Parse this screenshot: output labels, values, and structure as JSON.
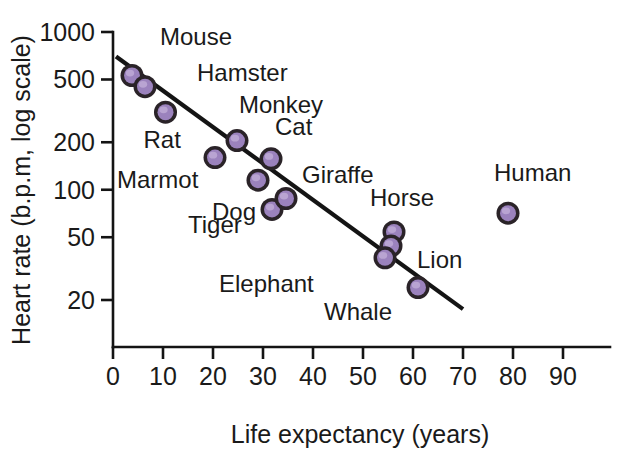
{
  "chart_data": {
    "type": "scatter",
    "title": "",
    "xlabel": "Life expectancy (years)",
    "ylabel": "Heart rate (b.p.m, log scale)",
    "yscale": "log",
    "xlim": [
      0,
      92
    ],
    "ylim": [
      16,
      1100
    ],
    "grid": false,
    "legend": null,
    "xticks": [
      "0",
      "10",
      "20",
      "30",
      "40",
      "50",
      "60",
      "70",
      "80",
      "90"
    ],
    "xtick_values": [
      0,
      10,
      20,
      30,
      40,
      50,
      60,
      70,
      80,
      90
    ],
    "yticks": [
      "1000",
      "500",
      "200",
      "100",
      "50",
      "20"
    ],
    "ytick_values": [
      1000,
      500,
      200,
      100,
      50,
      20
    ],
    "points": [
      {
        "label": "Mouse",
        "x": 3.8,
        "y": 530,
        "label_dx": 28,
        "label_dy": -30
      },
      {
        "label": "Hamster",
        "x": 6.4,
        "y": 450,
        "label_dx": 52,
        "label_dy": -6
      },
      {
        "label": "Rat",
        "x": 10.5,
        "y": 310,
        "label_dx": -22,
        "label_dy": 36
      },
      {
        "label": "Marmot",
        "x": 20.4,
        "y": 160,
        "label_dx": -98,
        "label_dy": 30
      },
      {
        "label": "Monkey",
        "x": 24.8,
        "y": 205,
        "label_dx": 2,
        "label_dy": -28
      },
      {
        "label": "Cat",
        "x": 31.6,
        "y": 157,
        "label_dx": 4,
        "label_dy": -24
      },
      {
        "label": "Dog",
        "x": 29.0,
        "y": 115,
        "label_dx": -46,
        "label_dy": 40
      },
      {
        "label": "Tiger",
        "x": 31.8,
        "y": 75,
        "label_dx": -84,
        "label_dy": 24
      },
      {
        "label": "Giraffe",
        "x": 34.6,
        "y": 88,
        "label_dx": 16,
        "label_dy": -16
      },
      {
        "label": "Horse",
        "x": 56.2,
        "y": 54,
        "label_dx": -24,
        "label_dy": -26
      },
      {
        "label": "Lion",
        "x": 55.6,
        "y": 44,
        "label_dx": 26,
        "label_dy": 22
      },
      {
        "label": "Elephant",
        "x": 54.4,
        "y": 37,
        "label_dx": -166,
        "label_dy": 34
      },
      {
        "label": "Whale",
        "x": 61.0,
        "y": 24,
        "label_dx": -94,
        "label_dy": 32
      },
      {
        "label": "Human",
        "x": 79.0,
        "y": 71,
        "label_dx": -14,
        "label_dy": -32
      }
    ],
    "trend_line": {
      "x_start": 0.6,
      "y_start": 700,
      "x_end": 70.0,
      "y_end": 17.5
    },
    "colors": {
      "marker_fill": "#9b82bd",
      "marker_edge": "#2a2328",
      "axis": "#141414",
      "text": "#1a1a1a",
      "background": "#ffffff"
    }
  }
}
